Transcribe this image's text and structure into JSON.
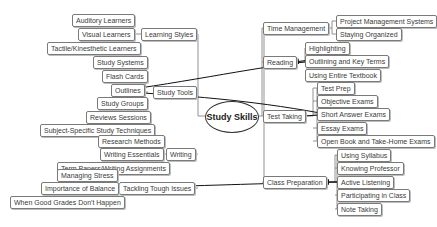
{
  "diagram": {
    "type": "mind-map",
    "center": {
      "label": "Study Skills"
    },
    "left_branches": [
      {
        "label": "Learning Styles",
        "children": [
          "Auditory Learners",
          "Visual Learners",
          "Tactile/Kinesthetic Learners"
        ]
      },
      {
        "label": "Study Tools",
        "children": [
          "Study Systems",
          "Flash Cards",
          "Outlines",
          "Study Groups",
          "Reviews Sessions",
          "Subject-Specific Study Techniques"
        ]
      },
      {
        "label": "Writing",
        "children": [
          "Research Methods",
          "Writing Essentials",
          "Term Papers/Writing Assignments"
        ]
      },
      {
        "label": "Tackling Tough Issues",
        "children": [
          "Managing Stress",
          "Importance of Balance",
          "When Good Grades Don't Happen"
        ]
      }
    ],
    "right_branches": [
      {
        "label": "Time Management",
        "children": [
          "Project Management Systems",
          "Staying Organized"
        ]
      },
      {
        "label": "Reading",
        "children": [
          "Highlighting",
          "Outlining and Key Terms",
          "Using Entire Textbook"
        ]
      },
      {
        "label": "Test Taking",
        "children": [
          "Test Prep",
          "Objective Exams",
          "Short Answer Exams",
          "Essay Exams",
          "Open Book and Take-Home Exams"
        ]
      },
      {
        "label": "Class Preparation",
        "children": [
          "Using Syllabus",
          "Knowing Professor",
          "Active Listening",
          "Participating in Class",
          "Note Taking"
        ]
      }
    ],
    "cross_links": [
      {
        "from": "Visual Learners",
        "to": "Study Tools"
      },
      {
        "from": "Outlining and Key Terms",
        "to": "Outlines"
      },
      {
        "from": "Short Answer Exams",
        "to": "Outlines"
      },
      {
        "from": "Importance of Balance",
        "to": "Class Preparation"
      },
      {
        "from": "Active Listening",
        "to": "Class Preparation"
      },
      {
        "from": "Outlining and Key Terms",
        "to": "Reading"
      },
      {
        "from": "Short Answer Exams",
        "to": "Test Taking"
      }
    ],
    "colors": {
      "line": "#555555",
      "node_border": "#7a7a7a",
      "text": "#3a3a3a",
      "arrow": "#111111"
    }
  }
}
